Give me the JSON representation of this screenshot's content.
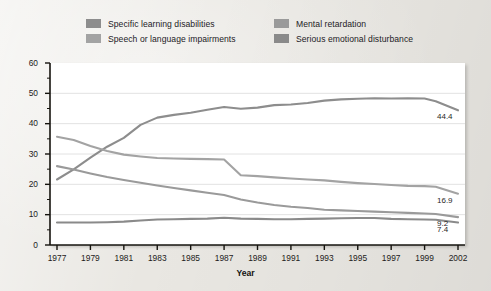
{
  "legend": {
    "items": [
      {
        "label": "Specific learning disabilities",
        "color": "#8d8d8d",
        "col": 1,
        "row": 1
      },
      {
        "label": "Speech or language impairments",
        "color": "#a3a3a3",
        "col": 1,
        "row": 2
      },
      {
        "label": "Mental retardation",
        "color": "#9a9a9a",
        "col": 2,
        "row": 1
      },
      {
        "label": "Serious emotional disturbance",
        "color": "#8a8a8a",
        "col": 2,
        "row": 2
      }
    ]
  },
  "axes": {
    "y_title": "Percent",
    "x_title": "Year",
    "y_ticks": [
      "0",
      "10",
      "20",
      "30",
      "40",
      "50",
      "60"
    ],
    "x_ticks": [
      "1977",
      "1979",
      "1981",
      "1983",
      "1985",
      "1987",
      "1989",
      "1991",
      "1993",
      "1995",
      "1997",
      "1999",
      "2002"
    ]
  },
  "end_labels": [
    {
      "text": "44.4",
      "series": "Specific learning disabilities"
    },
    {
      "text": "16.9",
      "series": "Speech or language impairments"
    },
    {
      "text": "9.2",
      "series": "Mental retardation"
    },
    {
      "text": "7.4",
      "series": "Serious emotional disturbance"
    }
  ],
  "chart_data": {
    "type": "line",
    "title": "",
    "xlabel": "Year",
    "ylabel": "Percent",
    "xlim": [
      1977,
      2002
    ],
    "ylim": [
      0,
      60
    ],
    "grid": true,
    "legend_position": "top",
    "x": [
      1977,
      1978,
      1979,
      1980,
      1981,
      1982,
      1983,
      1984,
      1985,
      1986,
      1987,
      1988,
      1989,
      1990,
      1991,
      1992,
      1993,
      1994,
      1995,
      1996,
      1997,
      1998,
      1999,
      2000,
      2002
    ],
    "series": [
      {
        "name": "Specific learning disabilities",
        "color": "#8d8d8d",
        "end_value": 44.4,
        "values": [
          21.6,
          24.9,
          28.8,
          32.4,
          35.3,
          39.6,
          42.0,
          42.9,
          43.6,
          44.6,
          45.5,
          44.9,
          45.3,
          46.1,
          46.3,
          46.8,
          47.6,
          48.0,
          48.2,
          48.4,
          48.3,
          48.4,
          48.3,
          47.4,
          44.4
        ]
      },
      {
        "name": "Speech or language impairments",
        "color": "#a3a3a3",
        "end_value": 16.9,
        "values": [
          35.7,
          34.6,
          32.6,
          31.0,
          29.8,
          29.2,
          28.7,
          28.5,
          28.4,
          28.3,
          28.2,
          23.0,
          22.7,
          22.3,
          21.9,
          21.6,
          21.3,
          20.8,
          20.4,
          20.1,
          19.8,
          19.5,
          19.4,
          19.2,
          16.9
        ]
      },
      {
        "name": "Mental retardation",
        "color": "#9a9a9a",
        "end_value": 9.2,
        "values": [
          26.0,
          24.9,
          23.6,
          22.4,
          21.4,
          20.5,
          19.6,
          18.8,
          18.0,
          17.2,
          16.5,
          15.0,
          14.0,
          13.2,
          12.6,
          12.2,
          11.6,
          11.4,
          11.2,
          11.0,
          10.8,
          10.6,
          10.4,
          10.2,
          9.2
        ]
      },
      {
        "name": "Serious emotional disturbance",
        "color": "#8a8a8a",
        "end_value": 7.4,
        "values": [
          7.4,
          7.4,
          7.4,
          7.5,
          7.7,
          8.1,
          8.4,
          8.5,
          8.6,
          8.7,
          9.0,
          8.7,
          8.6,
          8.5,
          8.5,
          8.6,
          8.7,
          8.8,
          8.9,
          8.9,
          8.6,
          8.5,
          8.4,
          8.3,
          7.4
        ]
      }
    ]
  }
}
